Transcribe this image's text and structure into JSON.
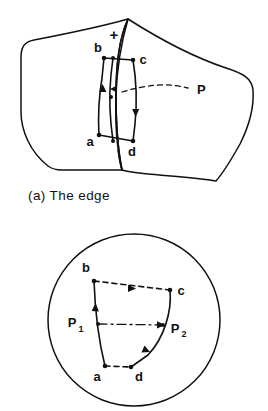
{
  "figure": {
    "panel_a": {
      "caption": "(a) The edge",
      "sign_marker": "+",
      "labels": {
        "b": "b",
        "c": "c",
        "a": "a",
        "d": "d",
        "p": "P"
      },
      "icons": {
        "left_surface": "curved-surface-shape",
        "right_surface": "curved-surface-shape",
        "edge": "edge-crease-line",
        "loop": "oriented-quadrilateral-loop",
        "lead_line": "dashed-leader-line"
      }
    },
    "panel_b": {
      "labels": {
        "b": "b",
        "c": "c",
        "a": "a",
        "d": "d",
        "p1_base": "P",
        "p1_sub": "1",
        "p2_base": "P",
        "p2_sub": "2"
      },
      "icons": {
        "boundary": "circle-outline",
        "loop": "oriented-quadrilateral-loop",
        "axis": "dash-dot-axis-line"
      }
    },
    "colors": {
      "ink": "#111111",
      "background": "#ffffff"
    }
  }
}
